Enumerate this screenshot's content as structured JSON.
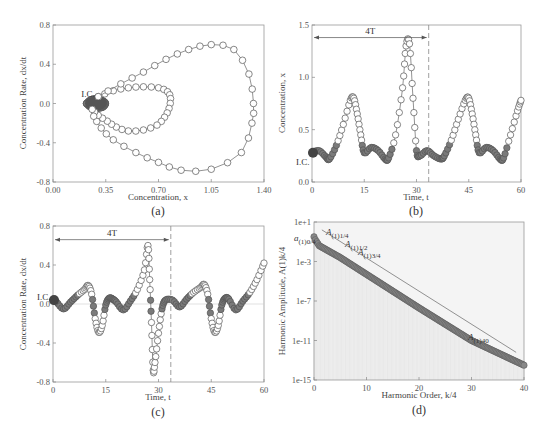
{
  "chart_data": [
    {
      "id": "a",
      "type": "scatter",
      "panel_label": "(a)",
      "title": "",
      "xlabel": "Concentration, x",
      "ylabel": "Concentration Rate, dx/dt",
      "xlim": [
        0.0,
        1.4
      ],
      "ylim": [
        -0.8,
        0.8
      ],
      "xticks": [
        "0.00",
        "0.35",
        "0.70",
        "1.05",
        "1.40"
      ],
      "yticks": [
        "-0.8",
        "-0.4",
        "0.0",
        "0.4",
        "0.8"
      ],
      "annotations": [
        {
          "text": "I.C.",
          "x": 0.28,
          "y": 0.02
        }
      ],
      "description": "Phase portrait: small inner ellipse near x≈0.28 (dense filled markers), mid loop up to x≈0.78, large loop up to x≈1.33",
      "series": [
        {
          "name": "small-loop",
          "points": [
            [
              0.22,
              0.0
            ],
            [
              0.25,
              0.04
            ],
            [
              0.29,
              0.05
            ],
            [
              0.33,
              0.03
            ],
            [
              0.35,
              0.0
            ],
            [
              0.33,
              -0.04
            ],
            [
              0.29,
              -0.05
            ],
            [
              0.25,
              -0.04
            ]
          ]
        },
        {
          "name": "mid-loop",
          "points": [
            [
              0.3,
              0.07
            ],
            [
              0.4,
              0.13
            ],
            [
              0.5,
              0.16
            ],
            [
              0.6,
              0.17
            ],
            [
              0.7,
              0.16
            ],
            [
              0.76,
              0.12
            ],
            [
              0.78,
              0.05
            ],
            [
              0.77,
              -0.05
            ],
            [
              0.74,
              -0.14
            ],
            [
              0.69,
              -0.22
            ],
            [
              0.6,
              -0.27
            ],
            [
              0.5,
              -0.28
            ],
            [
              0.42,
              -0.24
            ],
            [
              0.36,
              -0.18
            ],
            [
              0.3,
              -0.12
            ],
            [
              0.26,
              -0.06
            ]
          ]
        },
        {
          "name": "large-loop",
          "points": [
            [
              0.3,
              0.07
            ],
            [
              0.45,
              0.2
            ],
            [
              0.6,
              0.32
            ],
            [
              0.75,
              0.45
            ],
            [
              0.9,
              0.55
            ],
            [
              1.05,
              0.6
            ],
            [
              1.2,
              0.55
            ],
            [
              1.3,
              0.3
            ],
            [
              1.33,
              0.0
            ],
            [
              1.32,
              -0.2
            ],
            [
              1.25,
              -0.5
            ],
            [
              1.05,
              -0.67
            ],
            [
              0.85,
              -0.68
            ],
            [
              0.7,
              -0.6
            ],
            [
              0.55,
              -0.5
            ],
            [
              0.4,
              -0.37
            ],
            [
              0.32,
              -0.25
            ],
            [
              0.27,
              -0.13
            ]
          ]
        }
      ]
    },
    {
      "id": "b",
      "type": "line",
      "panel_label": "(b)",
      "xlabel": "Time, t",
      "ylabel": "Concentration, x",
      "xlim": [
        0,
        60
      ],
      "ylim": [
        0.0,
        1.5
      ],
      "xticks": [
        "0",
        "15",
        "30",
        "45",
        "60"
      ],
      "yticks": [
        "0.0",
        "0.5",
        "1.0",
        "1.5"
      ],
      "annotations": [
        {
          "text": "I.C.",
          "x": 0,
          "y": 0.28
        },
        {
          "text": "4T",
          "x": 16.5,
          "y": 1.38,
          "arrow_from": 0,
          "arrow_to": 33.5
        }
      ],
      "vline_dashed": 33.5,
      "x": [
        0,
        2,
        4,
        5,
        7,
        9,
        11,
        12,
        13,
        14,
        15,
        17,
        19,
        21,
        22,
        24,
        26,
        27,
        28,
        29,
        30,
        31,
        33,
        35,
        37,
        38,
        40,
        42,
        44,
        45,
        46,
        47,
        48,
        50,
        52,
        54,
        55,
        57,
        59,
        60
      ],
      "values": [
        0.28,
        0.3,
        0.24,
        0.22,
        0.35,
        0.55,
        0.78,
        0.8,
        0.65,
        0.45,
        0.28,
        0.33,
        0.3,
        0.22,
        0.23,
        0.45,
        0.9,
        1.3,
        1.32,
        0.8,
        0.3,
        0.25,
        0.3,
        0.25,
        0.22,
        0.25,
        0.4,
        0.6,
        0.78,
        0.8,
        0.65,
        0.45,
        0.28,
        0.33,
        0.3,
        0.22,
        0.23,
        0.45,
        0.68,
        0.78
      ]
    },
    {
      "id": "c",
      "type": "line",
      "panel_label": "(c)",
      "xlabel": "Time, t",
      "ylabel": "Concentration Rate, dx/dt",
      "xlim": [
        0,
        60
      ],
      "ylim": [
        -0.8,
        0.8
      ],
      "xticks": [
        "0",
        "15",
        "30",
        "45",
        "60"
      ],
      "yticks": [
        "-0.8",
        "-0.4",
        "0.0",
        "0.4",
        "0.8"
      ],
      "annotations": [
        {
          "text": "I.C.",
          "x": 0,
          "y": 0.04
        },
        {
          "text": "4T",
          "x": 16.5,
          "y": 0.66,
          "arrow_from": 0,
          "arrow_to": 33.5
        }
      ],
      "vline_dashed": 33.5,
      "x": [
        0,
        1,
        3,
        5,
        7,
        9,
        10,
        11,
        12,
        13,
        14,
        15,
        16,
        17,
        18,
        20,
        22,
        24,
        26,
        27,
        27.5,
        28,
        28.5,
        29,
        30,
        31,
        32,
        34,
        36,
        38,
        40,
        42,
        43,
        44,
        45,
        46,
        47,
        48,
        49,
        50,
        52,
        54,
        56,
        58,
        60
      ],
      "values": [
        0.04,
        0.02,
        -0.05,
        0.02,
        0.09,
        0.15,
        0.19,
        0.1,
        -0.15,
        -0.29,
        -0.22,
        -0.01,
        0.06,
        0.05,
        0.02,
        -0.06,
        0.03,
        0.15,
        0.35,
        0.6,
        0.25,
        -0.19,
        -0.68,
        -0.6,
        -0.3,
        -0.05,
        0.04,
        0.04,
        -0.03,
        0.05,
        0.12,
        0.17,
        0.2,
        0.1,
        -0.15,
        -0.29,
        -0.22,
        -0.01,
        0.06,
        0.05,
        -0.06,
        0.03,
        0.12,
        0.25,
        0.42
      ]
    },
    {
      "id": "d",
      "type": "line",
      "panel_label": "(d)",
      "xlabel": "Harmonic Order, k/4",
      "ylabel": "Harmonic Amplitude, A(1)k/4",
      "xlim": [
        0,
        40
      ],
      "ylim_log10": [
        -15,
        1
      ],
      "yscale": "log",
      "xticks": [
        "0",
        "10",
        "20",
        "30",
        "40"
      ],
      "yticks": [
        "1e+1",
        "1e-3",
        "1e-7",
        "1e-11",
        "1e-15"
      ],
      "annotations": [
        {
          "text": "a(1)0/4",
          "main": "a",
          "sub": "(1)0/4"
        },
        {
          "text": "A(1)1/4",
          "main": "A",
          "sub": "(1)1/4"
        },
        {
          "text": "A(1)1/2",
          "main": "A",
          "sub": "(1)1/2"
        },
        {
          "text": "A(1)3/4",
          "main": "A",
          "sub": "(1)3/4"
        },
        {
          "text": "A(1)40",
          "main": "A",
          "sub": "(1)40"
        }
      ],
      "x": [
        0,
        0.25,
        0.5,
        0.75,
        1,
        5,
        10,
        20,
        30,
        40
      ],
      "values_log10": [
        -0.5,
        -0.8,
        -1.0,
        -1.2,
        -1.4,
        -2.6,
        -4.3,
        -7.7,
        -11.0,
        -13.5
      ],
      "envelope_log10": {
        "x": [
          1.5,
          38.5
        ],
        "y": [
          0.2,
          -12.2
        ]
      }
    }
  ]
}
